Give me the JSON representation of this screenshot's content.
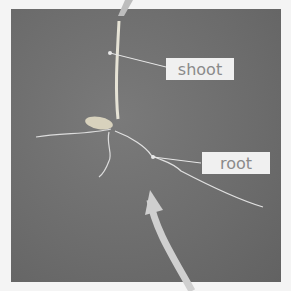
{
  "figure": {
    "labels": [
      {
        "id": "shoot",
        "text": "shoot"
      },
      {
        "id": "root",
        "text": "root"
      }
    ],
    "colors": {
      "background": "#f4f4f4",
      "photo_backdrop": "#6c6c6c",
      "label_box": "#f0f0f0",
      "label_text": "#8a8a8a",
      "arrow": "#c8c8c8"
    }
  }
}
